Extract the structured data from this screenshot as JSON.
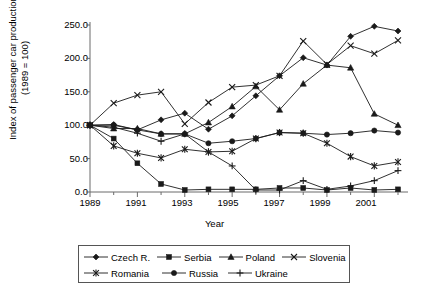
{
  "chart_data": {
    "type": "line",
    "title": "",
    "xlabel": "Year",
    "ylabel": "Index of passenger car production\n(1989 = 100)",
    "x": [
      1989,
      1990,
      1991,
      1992,
      1993,
      1994,
      1995,
      1996,
      1997,
      1998,
      1999,
      2000,
      2001,
      2002
    ],
    "xlim": [
      1989,
      2002
    ],
    "ylim": [
      0.0,
      250.0
    ],
    "yticks": [
      "0.0",
      "50.0",
      "100.0",
      "150.0",
      "200.0",
      "250.0"
    ],
    "ytick_values": [
      0,
      50,
      100,
      150,
      200,
      250
    ],
    "xticks": [
      "1989",
      "1991",
      "1993",
      "1995",
      "1997",
      "1999",
      "2001"
    ],
    "xtick_values": [
      1989,
      1991,
      1993,
      1995,
      1997,
      1999,
      2001
    ],
    "minor_xticks_every": 1,
    "grid": false,
    "legend_position": "below",
    "series": [
      {
        "name": "Czech R.",
        "marker": "diamond",
        "values": [
          100,
          101,
          93,
          108,
          118,
          94,
          114,
          144,
          174,
          201,
          190,
          233,
          248,
          241
        ]
      },
      {
        "name": "Serbia",
        "marker": "square",
        "values": [
          100,
          80,
          43,
          12,
          3,
          4,
          4,
          4,
          6,
          6,
          3,
          6,
          3,
          4
        ]
      },
      {
        "name": "Poland",
        "marker": "triangle",
        "values": [
          100,
          95,
          95,
          87,
          87,
          104,
          128,
          158,
          123,
          162,
          190,
          186,
          117,
          100
        ]
      },
      {
        "name": "Slovenia",
        "marker": "cross-x",
        "values": [
          100,
          133,
          145,
          150,
          102,
          134,
          157,
          160,
          174,
          226,
          191,
          219,
          207,
          227
        ]
      },
      {
        "name": "Romania",
        "marker": "asterisk",
        "values": [
          100,
          69,
          58,
          51,
          64,
          60,
          61,
          80,
          89,
          88,
          73,
          53,
          39,
          45
        ]
      },
      {
        "name": "Russia",
        "marker": "circle",
        "values": [
          100,
          100,
          93,
          87,
          87,
          73,
          76,
          80,
          89,
          88,
          86,
          88,
          92,
          89
        ]
      },
      {
        "name": "Ukraine",
        "marker": "plus",
        "values": [
          100,
          97,
          88,
          76,
          87,
          60,
          39,
          3,
          3,
          17,
          4,
          9,
          17,
          32
        ]
      }
    ]
  },
  "axes": {
    "y_axis_title": "Index of passenger car production",
    "y_axis_subtitle": "(1989 = 100)",
    "x_axis_title": "Year"
  },
  "colors": {
    "line": "#1a1a1a",
    "axis": "#6b6b6b",
    "legend_border": "#555555",
    "background": "#ffffff"
  }
}
